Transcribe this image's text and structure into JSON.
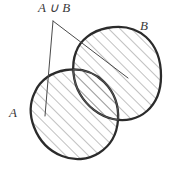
{
  "figure": {
    "type": "venn-diagram",
    "caption_labels": {
      "union": "A ∪ B",
      "set_a": "A",
      "set_b": "B"
    },
    "colors": {
      "background": "#ffffff",
      "outline_outer": "#2b2b2b",
      "outline_inner": "#555555",
      "hatch": "#6b6b6b",
      "leader": "#4a4a4a",
      "text": "#3a3a3a"
    },
    "hatching": {
      "angle_deg": 45,
      "direction": "bottom-left-to-top-right",
      "spacing_px": 8
    },
    "label_positions": {
      "union": {
        "x": 38,
        "y": 12
      },
      "set_a": {
        "x": 9,
        "y": 117
      },
      "set_b": {
        "x": 140,
        "y": 30
      }
    },
    "leader_lines": [
      {
        "name": "vertical-leader",
        "x1": 53,
        "y1": 21,
        "x2": 45,
        "y2": 116
      },
      {
        "name": "diagonal-leader",
        "x1": 53,
        "y1": 21,
        "x2": 128,
        "y2": 78
      }
    ],
    "shapes": [
      {
        "name": "set-b-blob",
        "label": "B",
        "role": "upper-right-region"
      },
      {
        "name": "set-a-blob",
        "label": "A",
        "role": "lower-left-region"
      }
    ]
  }
}
